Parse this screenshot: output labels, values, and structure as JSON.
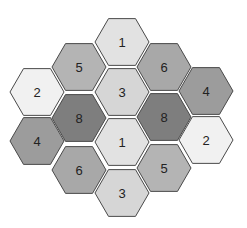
{
  "diagram": {
    "type": "hexagon-grid",
    "hex_radius": 27,
    "shades": {
      "1": "#e2e2e2",
      "2": "#f1f1f1",
      "3": "#d6d6d6",
      "4": "#9c9c9c",
      "5": "#b4b4b4",
      "6": "#a8a8a8",
      "8": "#7e7e7e"
    },
    "cells": [
      {
        "label": "1",
        "cx": 122,
        "cy": 42
      },
      {
        "label": "5",
        "cx": 79,
        "cy": 67
      },
      {
        "label": "6",
        "cx": 164,
        "cy": 67
      },
      {
        "label": "2",
        "cx": 37,
        "cy": 92
      },
      {
        "label": "3",
        "cx": 122,
        "cy": 92
      },
      {
        "label": "4",
        "cx": 206,
        "cy": 91
      },
      {
        "label": "8",
        "cx": 79,
        "cy": 118
      },
      {
        "label": "8",
        "cx": 164,
        "cy": 117
      },
      {
        "label": "4",
        "cx": 37,
        "cy": 141
      },
      {
        "label": "1",
        "cx": 122,
        "cy": 142
      },
      {
        "label": "2",
        "cx": 206,
        "cy": 140
      },
      {
        "label": "6",
        "cx": 79,
        "cy": 170
      },
      {
        "label": "5",
        "cx": 164,
        "cy": 168
      },
      {
        "label": "3",
        "cx": 122,
        "cy": 193
      }
    ]
  }
}
